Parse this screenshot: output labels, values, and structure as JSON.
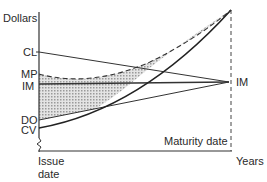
{
  "diagram": {
    "y_axis_label": "Dollars",
    "x_axis_label": "Years",
    "x_start_label_line1": "Issue",
    "x_start_label_line2": "date",
    "maturity_label": "Maturity date",
    "right_point_label": "IM",
    "left_labels": {
      "cl": "CL",
      "mp": "MP",
      "im": "IM",
      "do": "DO",
      "cv": "CV"
    },
    "colors": {
      "line": "#333333",
      "shade": "#c8c8c8",
      "background": "#ffffff"
    }
  }
}
